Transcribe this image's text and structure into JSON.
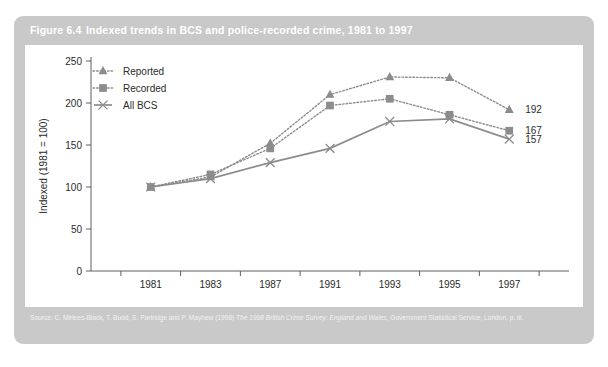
{
  "figure": {
    "number": "Figure 6.4",
    "title": "Indexed trends in BCS and police-recorded crime, 1981 to 1997",
    "source_prefix": "Source: C. Mirlees-Black, T. Budd, S. Partridge and P. Mayhew (1998) ",
    "source_italic": "The 1998 British Crime Survey: England and Wales",
    "source_suffix": ", Government Statistical Service, London, p. iii.",
    "header_bg": "#c9c9c9",
    "panel_bg": "#ffffff"
  },
  "chart_data": {
    "type": "line",
    "title": "Indexed trends in BCS and police-recorded crime, 1981 to 1997",
    "xlabel": "",
    "ylabel": "Indexed (1981 = 100)",
    "x": [
      1981,
      1983,
      1987,
      1991,
      1993,
      1995,
      1997
    ],
    "xtick_labels": [
      "1981",
      "1983",
      "1987",
      "1991",
      "1993",
      "1995",
      "1997"
    ],
    "xlim": [
      1980,
      1998
    ],
    "ylim": [
      0,
      250
    ],
    "ytick_labels": [
      "0",
      "50",
      "100",
      "150",
      "200",
      "250"
    ],
    "yticks": [
      0,
      50,
      100,
      150,
      200,
      250
    ],
    "grid": false,
    "legend_position": "top-left",
    "series": [
      {
        "name": "Reported",
        "marker": "triangle",
        "line_style": "dotted",
        "color": "#8c8c8c",
        "values": [
          100,
          112,
          152,
          210,
          231,
          230,
          192
        ],
        "end_label": "192"
      },
      {
        "name": "Recorded",
        "marker": "square",
        "line_style": "dotted",
        "color": "#8c8c8c",
        "values": [
          100,
          115,
          146,
          197,
          205,
          186,
          167
        ],
        "end_label": "167"
      },
      {
        "name": "All BCS",
        "marker": "cross",
        "line_style": "solid",
        "color": "#8c8c8c",
        "values": [
          100,
          110,
          129,
          146,
          178,
          181,
          157
        ],
        "end_label": "157"
      }
    ]
  },
  "legend": {
    "items": [
      {
        "label": "Reported",
        "marker": "triangle-icon"
      },
      {
        "label": "Recorded",
        "marker": "square-icon"
      },
      {
        "label": "All BCS",
        "marker": "cross-icon"
      }
    ]
  }
}
